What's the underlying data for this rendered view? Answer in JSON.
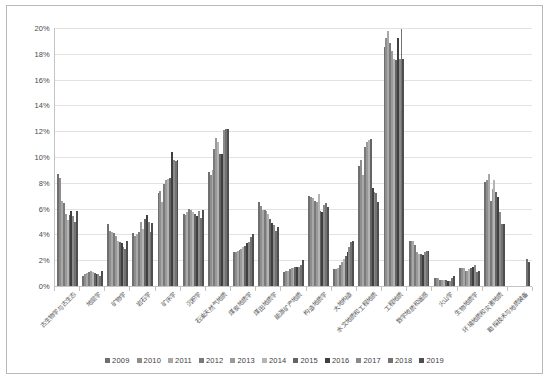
{
  "chart_data": {
    "type": "bar",
    "title": "",
    "subtitle": "",
    "xlabel": "",
    "ylabel": "",
    "ylim": [
      0,
      0.2
    ],
    "y_tick_labels": [
      "0%",
      "2%",
      "4%",
      "6%",
      "8%",
      "10%",
      "12%",
      "14%",
      "16%",
      "18%",
      "20%"
    ],
    "y_tick_values": [
      0,
      2,
      4,
      6,
      8,
      10,
      12,
      14,
      16,
      18,
      20
    ],
    "value_unit": "percent",
    "grid": "horizontal",
    "legend_position": "bottom",
    "legend_entries": [
      "2009",
      "2010",
      "2011",
      "2012",
      "2013",
      "2014",
      "2015",
      "2016",
      "2017",
      "2018",
      "2019"
    ],
    "series_colors": [
      "#6f6f6f",
      "#8e8e8e",
      "#a8a8a8",
      "#7a7a7a",
      "#9a9a9a",
      "#b4b4b4",
      "#646464",
      "#3f3f3f",
      "#8a8a8a",
      "#727272",
      "#4f4f4f"
    ],
    "categories": [
      "古生物学与古生态",
      "地层学",
      "矿物学",
      "岩石学",
      "矿床学",
      "沉积学",
      "石油天然气地质",
      "煤炭地质学",
      "煤田地质学",
      "能源矿产地质",
      "构造地质学",
      "大地构造",
      "水文地质和工程地质",
      "工程地质",
      "数学地质和遥感",
      "火山学",
      "生物地质学",
      "环境地质和灾害地质",
      "勘探技术与地质装备"
    ],
    "series": [
      {
        "name": "2009",
        "values": [
          8.7,
          0.8,
          4.8,
          4.1,
          7.2,
          5.6,
          8.8,
          2.6,
          6.5,
          1.1,
          7.0,
          1.3,
          9.3,
          18.5,
          3.5,
          0.6,
          1.4,
          8.1,
          0.0
        ]
      },
      {
        "name": "2010",
        "values": [
          8.4,
          0.9,
          4.3,
          3.9,
          7.4,
          5.5,
          8.6,
          2.6,
          6.2,
          1.2,
          6.9,
          1.3,
          9.8,
          19.2,
          3.5,
          0.6,
          1.4,
          8.2,
          0.0
        ]
      },
      {
        "name": "2011",
        "values": [
          6.6,
          1.0,
          4.2,
          4.0,
          6.5,
          5.7,
          9.0,
          2.7,
          5.9,
          1.2,
          6.8,
          1.4,
          8.6,
          19.8,
          3.5,
          0.6,
          1.4,
          8.7,
          0.0
        ]
      },
      {
        "name": "2012",
        "values": [
          6.4,
          1.1,
          4.1,
          4.2,
          7.9,
          6.0,
          10.6,
          2.8,
          5.9,
          1.3,
          6.6,
          1.6,
          10.8,
          18.8,
          3.2,
          0.5,
          1.2,
          6.6,
          0.0
        ]
      },
      {
        "name": "2013",
        "values": [
          5.6,
          1.2,
          3.9,
          5.0,
          8.2,
          5.9,
          11.5,
          2.9,
          5.8,
          1.4,
          6.5,
          1.9,
          11.2,
          18.2,
          2.6,
          0.5,
          1.2,
          7.5,
          0.0
        ]
      },
      {
        "name": "2014",
        "values": [
          5.1,
          1.1,
          3.5,
          4.4,
          8.3,
          5.7,
          11.2,
          3.0,
          5.6,
          1.4,
          7.1,
          2.1,
          11.3,
          17.6,
          2.5,
          0.5,
          1.3,
          8.2,
          0.0
        ]
      },
      {
        "name": "2015",
        "values": [
          5.5,
          1.0,
          3.4,
          5.2,
          8.4,
          5.6,
          10.2,
          3.1,
          5.2,
          1.5,
          5.8,
          2.3,
          11.4,
          17.5,
          2.5,
          0.5,
          1.4,
          7.3,
          0.0
        ]
      },
      {
        "name": "2016",
        "values": [
          5.8,
          0.9,
          3.3,
          5.5,
          10.4,
          5.4,
          10.2,
          3.3,
          4.9,
          1.5,
          5.7,
          2.6,
          7.6,
          19.2,
          2.4,
          0.4,
          1.5,
          6.9,
          0.0
        ]
      },
      {
        "name": "2017",
        "values": [
          5.4,
          0.9,
          3.0,
          5.0,
          9.8,
          5.8,
          12.1,
          3.4,
          4.7,
          1.5,
          6.3,
          3.0,
          7.3,
          17.6,
          2.6,
          0.4,
          1.6,
          5.7,
          0.0
        ]
      },
      {
        "name": "2018",
        "values": [
          5.0,
          0.8,
          2.9,
          4.2,
          9.7,
          5.3,
          12.2,
          3.8,
          4.3,
          1.6,
          6.4,
          3.4,
          7.2,
          19.9,
          2.7,
          0.6,
          1.1,
          4.8,
          2.1
        ]
      },
      {
        "name": "2019",
        "values": [
          5.8,
          1.2,
          3.5,
          4.9,
          9.8,
          5.9,
          12.2,
          4.0,
          4.6,
          2.0,
          6.1,
          3.5,
          6.5,
          17.6,
          2.7,
          0.8,
          1.2,
          4.8,
          1.9
        ]
      }
    ]
  }
}
